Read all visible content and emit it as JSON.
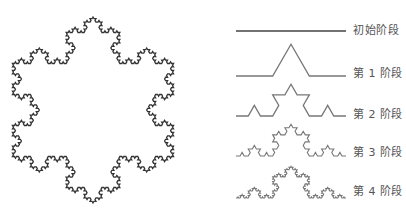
{
  "snowflake": {
    "center_x": 93,
    "center_y": 110,
    "radius": 93,
    "iterations": 4,
    "stroke": "#333333",
    "stroke_width": 1.3
  },
  "stages": [
    {
      "label": "初始阶段",
      "iterations": 0,
      "x0": 236,
      "x1": 346,
      "baseline_y": 31,
      "label_x": 353,
      "label_y": 25
    },
    {
      "label": "第 1 阶段",
      "iterations": 1,
      "x0": 236,
      "x1": 346,
      "baseline_y": 76,
      "label_x": 353,
      "label_y": 68
    },
    {
      "label": "第 2 阶段",
      "iterations": 2,
      "x0": 236,
      "x1": 346,
      "baseline_y": 116,
      "label_x": 353,
      "label_y": 109
    },
    {
      "label": "第 3 阶段",
      "iterations": 3,
      "x0": 236,
      "x1": 346,
      "baseline_y": 156,
      "label_x": 353,
      "label_y": 147
    },
    {
      "label": "第 4 阶段",
      "iterations": 4,
      "x0": 236,
      "x1": 346,
      "baseline_y": 198,
      "label_x": 353,
      "label_y": 186
    }
  ],
  "stage_stroke": "#777777",
  "stage_stroke_dark": "#444444"
}
